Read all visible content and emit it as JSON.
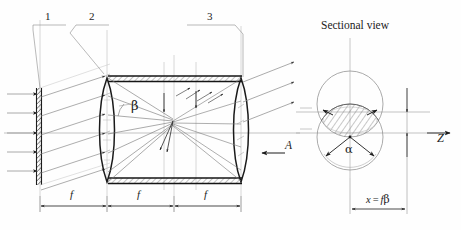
{
  "figure": {
    "title": "Sectional view",
    "background_color": "#fefefe",
    "ink_color": "#1c1c1c",
    "light_ink_color": "#8a8a8a",
    "callouts": [
      {
        "id": "callout-1",
        "label": "1"
      },
      {
        "id": "callout-2",
        "label": "2"
      },
      {
        "id": "callout-3",
        "label": "3"
      }
    ],
    "angle_labels": {
      "beta": "β",
      "alpha": "α"
    },
    "axis_labels": {
      "z": "Z",
      "aperture": "A"
    },
    "dimensions": [
      {
        "id": "focal-1",
        "label": "f"
      },
      {
        "id": "focal-2",
        "label": "f"
      },
      {
        "id": "focal-3",
        "label": "f"
      }
    ],
    "formula": "x = fβ",
    "formula_parts": {
      "variable": "x",
      "equals": "=",
      "focal": "f",
      "angle": "β"
    }
  }
}
